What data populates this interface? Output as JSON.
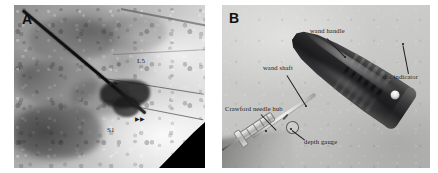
{
  "figure": {
    "type": "two-panel-scientific-figure",
    "background_color": "#ffffff"
  },
  "panel_a": {
    "letter": "A",
    "modality": "fluoroscopy",
    "colors": {
      "film_light": "#ededed",
      "film_dark": "#8e8e8e",
      "needle": "#0b0b0b",
      "wedge": "#000000"
    },
    "annotations": [
      {
        "name": "vertebral-level-l5",
        "text": "L5"
      },
      {
        "name": "vertebral-level-s1",
        "text": "S1"
      }
    ],
    "markers": [
      {
        "name": "arrowhead-upper",
        "glyph": "▶▶"
      },
      {
        "name": "arrowhead-lower",
        "glyph": "▶▶"
      }
    ]
  },
  "panel_b": {
    "letter": "B",
    "modality": "photograph",
    "colors": {
      "background": "#c8c8c6",
      "handle_dark": "#1b1b1d",
      "handle_light": "#5d5d5b",
      "shaft": "#f0f0ee",
      "label_text": "#1a1a1a"
    },
    "labels": [
      {
        "name": "wand-handle",
        "text": "wand handle"
      },
      {
        "name": "dot-indicator",
        "text": "dot indicator"
      },
      {
        "name": "wand-shaft",
        "text": "wand shaft"
      },
      {
        "name": "crawford-needle-hub",
        "text": "Crawford needle hub"
      },
      {
        "name": "depth-gauge",
        "text": "depth gauge"
      }
    ]
  }
}
